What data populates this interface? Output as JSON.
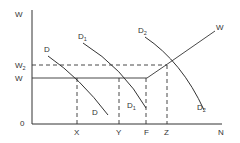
{
  "diagram": {
    "type": "labor-market-demand-shift",
    "axes": {
      "y_label": "W",
      "x_label": "N",
      "origin_label": "0"
    },
    "y_levels": [
      {
        "id": "w2",
        "label": "W",
        "subscript": "2",
        "style": "dashed"
      },
      {
        "id": "w",
        "label": "W",
        "subscript": "",
        "style": "solid"
      }
    ],
    "x_points": [
      {
        "id": "x",
        "label": "X"
      },
      {
        "id": "y",
        "label": "Y"
      },
      {
        "id": "f",
        "label": "F"
      },
      {
        "id": "z",
        "label": "Z"
      }
    ],
    "curves": {
      "d": {
        "top_label": "D",
        "bottom_label": "D",
        "subscript": ""
      },
      "d1": {
        "top_label": "D",
        "bottom_label": "D",
        "subscript": "1"
      },
      "d2": {
        "top_label": "D",
        "bottom_label": "D",
        "subscript": "2"
      },
      "supply": {
        "label": "W"
      }
    },
    "colors": {
      "line": "#333333",
      "background": "#ffffff"
    }
  }
}
